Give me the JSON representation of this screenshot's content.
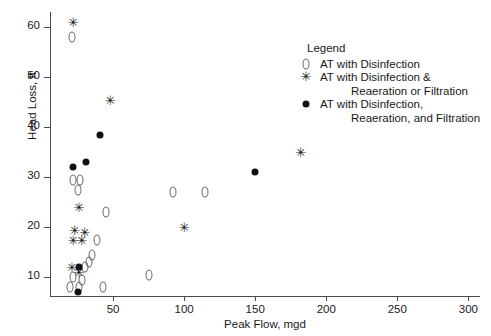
{
  "chart_data": {
    "type": "scatter",
    "title": "",
    "xlabel": "Peak Flow, mgd",
    "ylabel": "Head Loss, ft",
    "xlim": [
      0,
      300
    ],
    "ylim": [
      5,
      63
    ],
    "xticks": [
      50,
      100,
      150,
      200,
      250,
      300
    ],
    "yticks": [
      10,
      20,
      30,
      40,
      50,
      60
    ],
    "grid": false,
    "legend_position": "upper-right-inside",
    "legend_title": "Legend",
    "series": [
      {
        "name": "AT with Disinfection",
        "marker": "diamond-open",
        "color": "#666666",
        "points": [
          [
            21,
            58.0
          ],
          [
            22,
            29.5
          ],
          [
            27,
            29.5
          ],
          [
            25,
            27.5
          ],
          [
            45,
            23.0
          ],
          [
            39,
            17.5
          ],
          [
            35,
            14.5
          ],
          [
            33,
            13.0
          ],
          [
            30,
            12.0
          ],
          [
            22,
            10.0
          ],
          [
            28,
            9.5
          ],
          [
            20,
            8.0
          ],
          [
            26,
            8.0
          ],
          [
            43,
            8.0
          ],
          [
            75,
            10.5
          ],
          [
            92,
            27.0
          ],
          [
            115,
            27.0
          ]
        ]
      },
      {
        "name": "AT with Disinfection & Reaeration or Filtration",
        "marker": "star",
        "color": "#111111",
        "points": [
          [
            22,
            61.0
          ],
          [
            48,
            45.5
          ],
          [
            26,
            24.0
          ],
          [
            23,
            19.5
          ],
          [
            30,
            19.0
          ],
          [
            22,
            17.5
          ],
          [
            28,
            17.5
          ],
          [
            21,
            12.0
          ],
          [
            26,
            11.0
          ],
          [
            100,
            20.0
          ],
          [
            182,
            35.0
          ]
        ]
      },
      {
        "name": "AT with Disinfection, Reaeration, and Filtration",
        "marker": "dot-filled",
        "color": "#111111",
        "points": [
          [
            41,
            38.5
          ],
          [
            31,
            33.0
          ],
          [
            22,
            32.0
          ],
          [
            26,
            12.0
          ],
          [
            25,
            7.0
          ],
          [
            150,
            31.0
          ]
        ]
      }
    ]
  },
  "axes": {
    "x_tick_labels": [
      "50",
      "100",
      "150",
      "200",
      "250",
      "300"
    ],
    "y_tick_labels": [
      "10",
      "20",
      "30",
      "40",
      "50",
      "60"
    ],
    "x_title": "Peak Flow, mgd",
    "y_title": "Head Loss, ft"
  },
  "legend": {
    "title": "Legend",
    "entries": [
      {
        "marker": "diamond-open",
        "lines": [
          "AT with Disinfection"
        ]
      },
      {
        "marker": "star",
        "lines": [
          "AT with Disinfection &",
          "Reaeration or Filtration"
        ]
      },
      {
        "marker": "dot-filled",
        "lines": [
          "AT with Disinfection,",
          "Reaeration, and Filtration"
        ]
      }
    ]
  }
}
